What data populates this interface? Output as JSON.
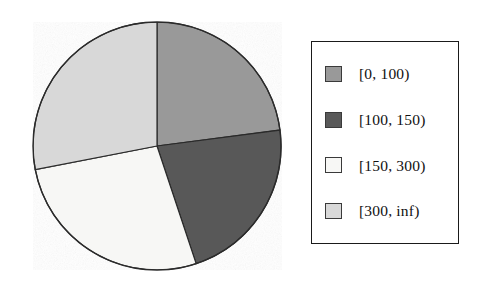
{
  "chart_data": {
    "type": "pie",
    "title": "",
    "subtitle": "",
    "xlabel": "",
    "ylabel": "",
    "grid": false,
    "legend_position": "right",
    "start_angle_deg": 90,
    "direction": "clockwise",
    "categories": [
      "[0, 100)",
      "[100, 150)",
      "[150, 300)",
      "[300, inf)"
    ],
    "values": [
      23,
      22,
      27,
      28
    ],
    "value_unit": "percent",
    "slice_angles_deg": [
      82.6,
      79.0,
      97.4,
      101.0
    ],
    "colors": [
      "#999999",
      "#595959",
      "#f7f7f5",
      "#d8d8d8"
    ],
    "slices": [
      {
        "label": "[0, 100)",
        "value": 23,
        "angle_deg": 82.6,
        "color": "#999999"
      },
      {
        "label": "[100, 150)",
        "value": 22,
        "angle_deg": 79.0,
        "color": "#595959"
      },
      {
        "label": "[150, 300)",
        "value": 27,
        "angle_deg": 97.4,
        "color": "#f7f7f5"
      },
      {
        "label": "[300, inf)",
        "value": 28,
        "angle_deg": 101.0,
        "color": "#d8d8d8"
      }
    ],
    "annotations": []
  },
  "pie": {
    "center_x": 157,
    "center_y": 146,
    "radius": 124,
    "edge_color": "#2b2b2b"
  },
  "legend": {
    "border_color": "#1a1a1a",
    "items": [
      {
        "label": "[0, 100)",
        "color": "#999999",
        "swatch_name": "legend-swatch-0-100"
      },
      {
        "label": "[100, 150)",
        "color": "#595959",
        "swatch_name": "legend-swatch-100-150"
      },
      {
        "label": "[150, 300)",
        "color": "#f7f7f5",
        "swatch_name": "legend-swatch-150-300"
      },
      {
        "label": "[300, inf)",
        "color": "#d8d8d8",
        "swatch_name": "legend-swatch-300-inf"
      }
    ]
  }
}
